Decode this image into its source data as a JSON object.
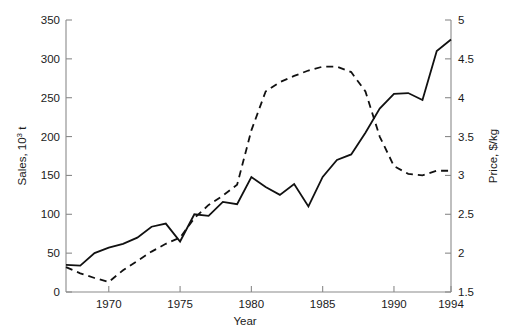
{
  "chart_data": {
    "type": "line",
    "title": "",
    "xlabel": "Year",
    "ylabel": "Sales, 10³ t",
    "y2label": "Price, $/kg",
    "xlim": [
      1967,
      1994
    ],
    "ylim": [
      0,
      350
    ],
    "y2lim": [
      1.5,
      5
    ],
    "grid": false,
    "legend": "none",
    "xticks": [
      1970,
      1975,
      1980,
      1985,
      1990,
      1994
    ],
    "xticklabels": [
      "1970",
      "1975",
      "1980",
      "1985",
      "1990",
      "1994"
    ],
    "yticks": [
      0,
      50,
      100,
      150,
      200,
      250,
      300,
      350
    ],
    "yticklabels": [
      "0",
      "50",
      "100",
      "150",
      "200",
      "250",
      "300",
      "350"
    ],
    "y2ticks": [
      1.5,
      2,
      2.5,
      3,
      3.5,
      4,
      4.5,
      5
    ],
    "y2ticklabels": [
      "1.5",
      "2",
      "2.5",
      "3",
      "3.5",
      "4",
      "4.5",
      "5"
    ],
    "series": [
      {
        "name": "Sales",
        "axis": "left",
        "style": "solid",
        "x": [
          1967,
          1968,
          1969,
          1970,
          1971,
          1972,
          1973,
          1974,
          1975,
          1976,
          1977,
          1978,
          1979,
          1980,
          1981,
          1982,
          1983,
          1984,
          1985,
          1986,
          1987,
          1988,
          1989,
          1990,
          1991,
          1992,
          1993,
          1994
        ],
        "values": [
          35,
          34,
          50,
          57,
          62,
          70,
          84,
          88,
          65,
          100,
          98,
          116,
          113,
          148,
          135,
          125,
          139,
          110,
          148,
          170,
          177,
          205,
          236,
          255,
          256,
          247,
          310,
          325
        ]
      },
      {
        "name": "Price",
        "axis": "right",
        "style": "dashed",
        "x": [
          1967,
          1968,
          1969,
          1970,
          1971,
          1972,
          1973,
          1974,
          1975,
          1976,
          1977,
          1978,
          1979,
          1980,
          1981,
          1982,
          1983,
          1984,
          1985,
          1986,
          1987,
          1988,
          1989,
          1990,
          1991,
          1992,
          1993,
          1994
        ],
        "values": [
          1.82,
          1.74,
          1.68,
          1.63,
          1.78,
          1.9,
          2.02,
          2.12,
          2.2,
          2.45,
          2.62,
          2.74,
          2.88,
          3.58,
          4.08,
          4.2,
          4.28,
          4.35,
          4.4,
          4.4,
          4.33,
          4.08,
          3.5,
          3.12,
          3.02,
          3.0,
          3.06,
          3.06
        ]
      }
    ],
    "annotations": []
  },
  "geometry": {
    "plot_left": 66,
    "plot_right": 451,
    "plot_top": 20,
    "plot_bottom": 292
  },
  "colors": {
    "line": "#111111",
    "axis": "#8a8a8a",
    "text": "#1a1a1a",
    "background": "#ffffff"
  }
}
